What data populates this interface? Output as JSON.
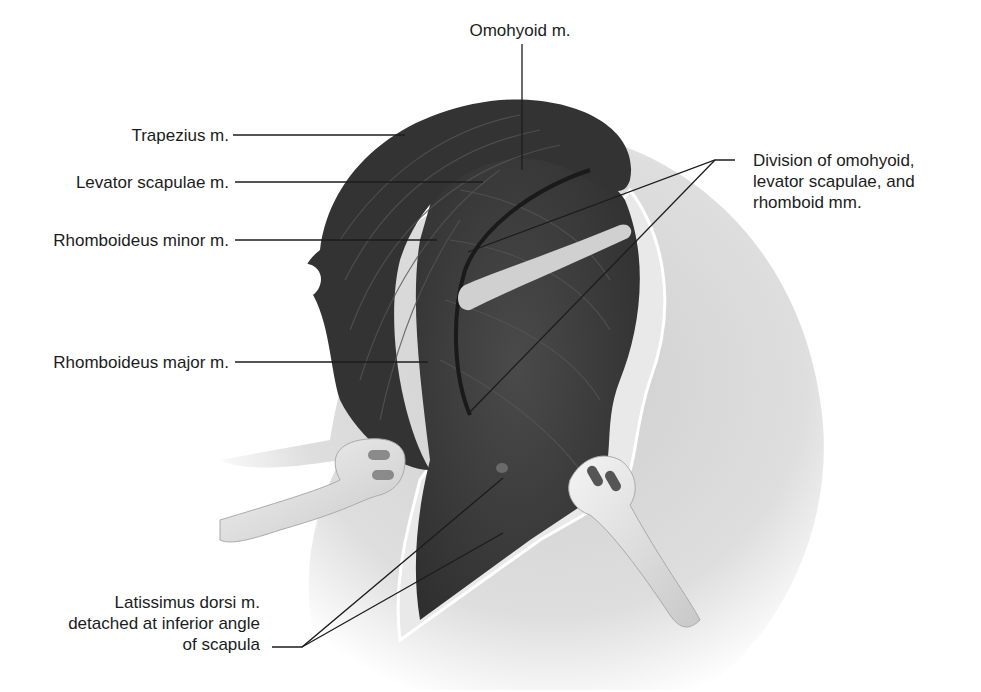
{
  "figure": {
    "colors": {
      "muscle_dark": "#3a3a3a",
      "muscle_mid": "#555555",
      "skin": "#d9d9d9",
      "skin_light": "#eeeeee",
      "retractor": "#e8e8e8",
      "leader_line": "#1c1c1c",
      "background": "#ffffff"
    }
  },
  "labels": {
    "omohyoid": "Omohyoid m.",
    "trapezius": "Trapezius m.",
    "levator": "Levator scapulae m.",
    "rhomboid_minor": "Rhomboideus minor m.",
    "rhomboid_major": "Rhomboideus major m.",
    "division": [
      "Division of omohyoid,",
      "levator scapulae, and",
      "rhomboid mm."
    ],
    "latissimus": [
      "Latissimus dorsi m.",
      "detached at inferior angle",
      "of scapula"
    ]
  }
}
